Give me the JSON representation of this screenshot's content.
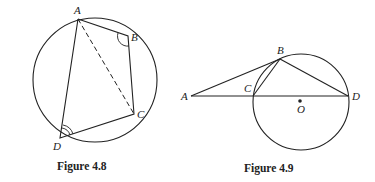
{
  "figures": [
    {
      "caption": "Figure 4.8",
      "labels": {
        "A": "A",
        "B": "B",
        "C": "C",
        "D": "D"
      }
    },
    {
      "caption": "Figure 4.9",
      "labels": {
        "A": "A",
        "B": "B",
        "C": "C",
        "D": "D",
        "O": "O"
      }
    }
  ]
}
